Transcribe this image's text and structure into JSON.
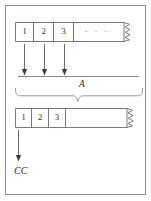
{
  "figure": {
    "background_color": "#ffffff",
    "frame_color": "#8f8f8f",
    "ink_color": "#2b2b2b"
  },
  "top_array": {
    "name": "source-array",
    "cells": [
      {
        "label": "1"
      },
      {
        "label": "2"
      },
      {
        "label": "3"
      },
      {
        "label": "·  ·  ·"
      }
    ],
    "torn_right_edge": true
  },
  "mapping_arrows": {
    "name": "mapping-arrows",
    "count": 3,
    "direction": "down"
  },
  "axis": {
    "name": "axis-A",
    "label": "A"
  },
  "brace": {
    "name": "grouping-brace",
    "direction": "down"
  },
  "bottom_array": {
    "name": "result-array",
    "cells": [
      {
        "label": "1"
      },
      {
        "label": "2"
      },
      {
        "label": "3"
      },
      {
        "label": ""
      }
    ],
    "torn_right_edge": true
  },
  "output_arrow": {
    "name": "output-arrow",
    "direction": "down",
    "label": "CC"
  }
}
